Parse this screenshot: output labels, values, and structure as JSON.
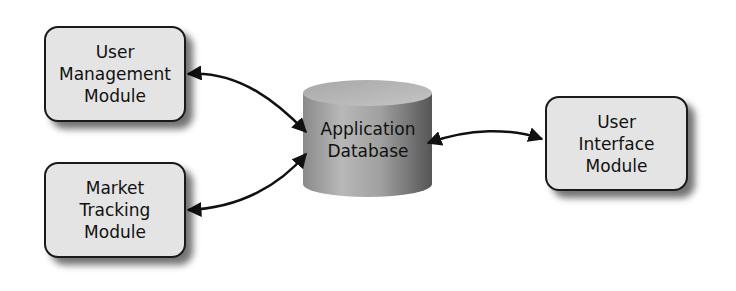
{
  "diagram": {
    "type": "architecture",
    "nodes": [
      {
        "id": "umm",
        "label": "User\nManagement\nModule",
        "shape": "rounded-rect"
      },
      {
        "id": "mtm",
        "label": "Market\nTracking\nModule",
        "shape": "rounded-rect"
      },
      {
        "id": "db",
        "label": "Application\nDatabase",
        "shape": "cylinder"
      },
      {
        "id": "uim",
        "label": "User\nInterface\nModule",
        "shape": "rounded-rect"
      }
    ],
    "edges": [
      {
        "from": "umm",
        "to": "db",
        "direction": "bidirectional"
      },
      {
        "from": "mtm",
        "to": "db",
        "direction": "bidirectional"
      },
      {
        "from": "db",
        "to": "uim",
        "direction": "bidirectional"
      }
    ]
  },
  "colors": {
    "box_fill": "#e4e4e4",
    "box_border": "#1a1a1a",
    "cylinder_light": "#c8c8c8",
    "cylinder_dark": "#5a5a5a",
    "arrow": "#111111"
  }
}
